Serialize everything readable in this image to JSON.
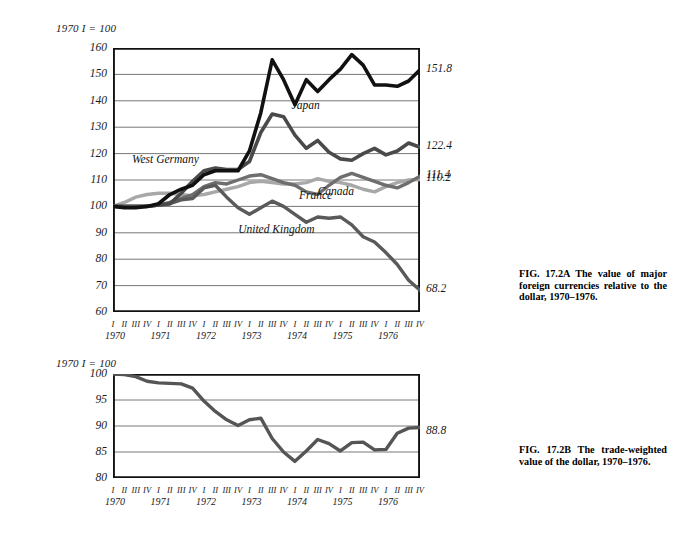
{
  "figure": {
    "panel_a": {
      "index_note": "1970 I = 100",
      "caption": "FIG. 17.2A The value of major foreign currencies relative to the dollar, 1970–1976.",
      "caption_lines": [
        "FIG. 17.2A The value of",
        "major foreign currencies rel-",
        "ative to the dollar, 1970–",
        "1976."
      ]
    },
    "panel_b": {
      "index_note": "1970 I = 100",
      "caption": "FIG. 17.2B The trade-weighted value of the dollar, 1970–1976.",
      "caption_lines": [
        "FIG. 17.2B The trade-",
        "weighted value of the dollar,",
        "1970–1976."
      ]
    }
  },
  "chart_data": [
    {
      "id": "panel-a",
      "type": "line",
      "title": "The value of major foreign currencies relative to the dollar, 1970–1976",
      "subtitle": "1970 I = 100",
      "xlabel": "",
      "ylabel": "",
      "ylim": [
        60,
        160
      ],
      "yticks": [
        60,
        70,
        80,
        90,
        100,
        110,
        120,
        130,
        140,
        150,
        160
      ],
      "grid": true,
      "legend": "inline-labels",
      "years": [
        1970,
        1971,
        1972,
        1973,
        1974,
        1975,
        1976
      ],
      "quarters": [
        "I",
        "II",
        "III",
        "IV"
      ],
      "x": [
        "1970 I",
        "1970 II",
        "1970 III",
        "1970 IV",
        "1971 I",
        "1971 II",
        "1971 III",
        "1971 IV",
        "1972 I",
        "1972 II",
        "1972 III",
        "1972 IV",
        "1973 I",
        "1973 II",
        "1973 III",
        "1973 IV",
        "1974 I",
        "1974 II",
        "1974 III",
        "1974 IV",
        "1975 I",
        "1975 II",
        "1975 III",
        "1975 IV",
        "1976 I",
        "1976 II",
        "1976 III",
        "1976 IV"
      ],
      "series": [
        {
          "name": "West Germany",
          "color": "#111111",
          "width": 3.6,
          "end_value": 151.8,
          "end_label": "151.8",
          "label_x": "1972 I",
          "values": [
            100.0,
            99.5,
            99.5,
            100.0,
            101.0,
            104.5,
            106.5,
            108.0,
            112.0,
            113.5,
            113.5,
            113.5,
            121.0,
            135.5,
            155.5,
            148.0,
            138.5,
            148.0,
            143.5,
            148.0,
            152.0,
            157.5,
            153.5,
            146.0,
            146.0,
            145.5,
            147.5,
            151.8
          ]
        },
        {
          "name": "Japan",
          "color": "#4a4a4a",
          "width": 3.6,
          "end_value": 122.4,
          "end_label": "122.4",
          "label_x": "1973 IV",
          "values": [
            100.0,
            100.0,
            100.0,
            100.0,
            100.5,
            101.0,
            105.0,
            109.5,
            113.5,
            114.5,
            114.0,
            114.0,
            117.0,
            128.0,
            135.0,
            134.0,
            127.0,
            122.0,
            125.0,
            120.5,
            118.0,
            117.5,
            120.0,
            122.0,
            119.5,
            121.0,
            124.0,
            122.4
          ]
        },
        {
          "name": "France",
          "color": "#6e6e6e",
          "width": 3.4,
          "end_value": 111.4,
          "end_label": "111.4",
          "label_x": "1974 I",
          "values": [
            100.0,
            100.0,
            100.0,
            100.0,
            100.5,
            101.5,
            103.0,
            104.5,
            107.5,
            109.0,
            108.5,
            110.0,
            111.5,
            112.0,
            110.5,
            109.0,
            108.0,
            105.5,
            104.5,
            108.0,
            111.0,
            112.5,
            111.0,
            109.5,
            108.0,
            107.0,
            109.0,
            111.4
          ]
        },
        {
          "name": "Canada",
          "color": "#a8a8a8",
          "width": 3.4,
          "end_value": 110.2,
          "end_label": "110.2",
          "label_x": "1974 III",
          "values": [
            100.0,
            101.5,
            103.5,
            104.5,
            105.0,
            105.0,
            104.5,
            104.0,
            104.5,
            105.5,
            106.5,
            107.5,
            109.0,
            109.5,
            109.0,
            108.5,
            108.5,
            109.0,
            110.5,
            109.5,
            109.0,
            108.0,
            106.5,
            105.5,
            107.5,
            109.0,
            110.0,
            110.2
          ]
        },
        {
          "name": "United Kingdom",
          "color": "#5a5a5a",
          "width": 3.4,
          "end_value": 68.2,
          "end_label": "68.2",
          "label_x": "1973 III",
          "values": [
            100.0,
            100.0,
            100.0,
            100.0,
            100.5,
            101.0,
            102.5,
            103.0,
            107.0,
            108.0,
            103.5,
            99.5,
            97.0,
            99.5,
            102.0,
            100.0,
            97.0,
            94.0,
            96.0,
            95.5,
            96.0,
            93.0,
            88.5,
            86.5,
            82.5,
            78.0,
            72.0,
            68.2
          ]
        }
      ]
    },
    {
      "id": "panel-b",
      "type": "line",
      "title": "The trade-weighted value of the dollar, 1970–1976",
      "subtitle": "1970 I = 100",
      "xlabel": "",
      "ylabel": "",
      "ylim": [
        80,
        100
      ],
      "yticks": [
        80,
        85,
        90,
        95,
        100
      ],
      "grid": true,
      "years": [
        1970,
        1971,
        1972,
        1973,
        1974,
        1975,
        1976
      ],
      "quarters": [
        "I",
        "II",
        "III",
        "IV"
      ],
      "x": [
        "1970 I",
        "1970 II",
        "1970 III",
        "1970 IV",
        "1971 I",
        "1971 II",
        "1971 III",
        "1971 IV",
        "1972 I",
        "1972 II",
        "1972 III",
        "1972 IV",
        "1973 I",
        "1973 II",
        "1973 III",
        "1973 IV",
        "1974 I",
        "1974 II",
        "1974 III",
        "1974 IV",
        "1975 I",
        "1975 II",
        "1975 III",
        "1975 IV",
        "1976 I",
        "1976 II",
        "1976 III",
        "1976 IV"
      ],
      "series": [
        {
          "name": "Trade-weighted dollar",
          "color": "#555555",
          "width": 3.4,
          "end_value": 88.8,
          "end_label": "88.8",
          "values": [
            100.0,
            99.9,
            99.5,
            98.6,
            98.3,
            98.2,
            98.1,
            97.3,
            94.8,
            92.8,
            91.2,
            90.1,
            91.2,
            91.5,
            87.6,
            85.0,
            83.2,
            85.2,
            87.4,
            86.6,
            85.2,
            86.8,
            86.9,
            85.4,
            85.5,
            88.6,
            89.6,
            89.7,
            88.8
          ]
        }
      ]
    }
  ]
}
